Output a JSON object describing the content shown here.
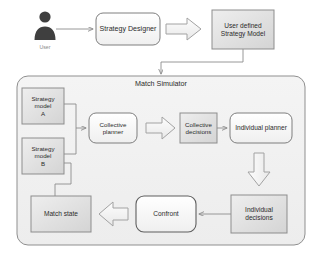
{
  "diagram": {
    "colors": {
      "stroke": "#9a9a9a",
      "stroke_dark": "#6f6f6f",
      "text": "#2b2b2b",
      "caption": "#8a8a8a",
      "box_fill_light": "#f7f7f7",
      "box_fill_gray": "#dcdcdc",
      "container_fill": "#f2f2f2",
      "arrow_fill": "#f0f0f0",
      "user_icon": "#3f3f3f"
    },
    "actor": {
      "icon": "user-icon",
      "caption": "User"
    },
    "top_flow": {
      "designer_label": "Strategy Designer",
      "block_arrow": "block-arrow-right",
      "model_label": "User defined\nStrategy Model"
    },
    "container": {
      "label": "Match Simulator"
    },
    "nodes": [
      {
        "id": "strategy-model-a",
        "label": "Strategy\nmodel\nA",
        "shape": "rect-gray"
      },
      {
        "id": "strategy-model-b",
        "label": "Strategy\nmodel\nB",
        "shape": "rect-gray"
      },
      {
        "id": "collective-planner",
        "label": "Collective\nplanner",
        "shape": "rounded"
      },
      {
        "id": "collective-decisions",
        "label": "Collective\ndecisions",
        "shape": "rect-gray"
      },
      {
        "id": "individual-planner",
        "label": "Individual planner",
        "shape": "rounded"
      },
      {
        "id": "individual-decisions",
        "label": "Individual\ndecisions",
        "shape": "rect-gray"
      },
      {
        "id": "confront",
        "label": "Confront",
        "shape": "rounded"
      },
      {
        "id": "match-state",
        "label": "Match state",
        "shape": "rect-gray"
      }
    ],
    "connectors": [
      {
        "from": "user",
        "to": "strategy-designer",
        "type": "line-arrow"
      },
      {
        "from": "strategy-designer",
        "to": "user-defined-strategy-model",
        "type": "block-arrow"
      },
      {
        "from": "user-defined-strategy-model",
        "to": "match-simulator",
        "type": "line-arrow"
      },
      {
        "from": "strategy-model-a",
        "to": "collective-planner",
        "type": "line-arrow"
      },
      {
        "from": "strategy-model-b",
        "to": "collective-planner",
        "type": "line-arrow"
      },
      {
        "from": "collective-planner",
        "to": "collective-decisions",
        "type": "block-arrow"
      },
      {
        "from": "collective-decisions",
        "to": "individual-planner",
        "type": "line-arrow"
      },
      {
        "from": "individual-planner",
        "to": "individual-decisions",
        "type": "block-arrow-down"
      },
      {
        "from": "individual-decisions",
        "to": "confront",
        "type": "line-arrow"
      },
      {
        "from": "confront",
        "to": "match-state",
        "type": "block-arrow-left"
      },
      {
        "from": "strategy-model-b",
        "to": "match-state",
        "type": "line"
      }
    ]
  }
}
